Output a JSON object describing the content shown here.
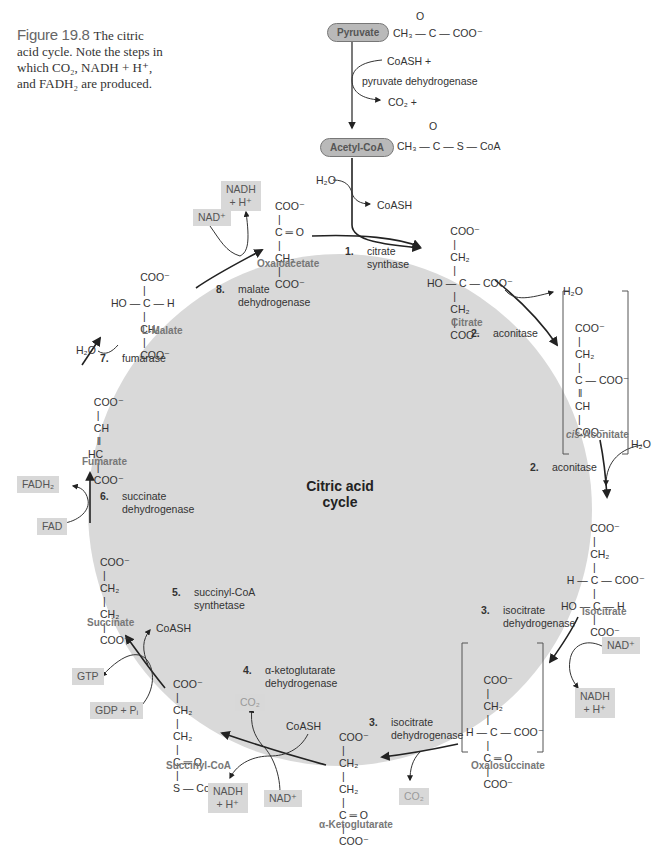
{
  "caption": {
    "figure_label": "Figure 19.8",
    "text": "The citric acid cycle. Note the steps in which CO₂, NADH + H⁺, and FADH₂ are produced."
  },
  "entry": {
    "pyruvate": {
      "label": "Pyruvate",
      "formula": "CH₃ — C — COO⁻",
      "carbonyl": "O"
    },
    "pdh_inputs": "CoASH +",
    "pdh_enzyme": "pyruvate dehydrogenase",
    "pdh_output": "CO₂ +",
    "acetyl_coa": {
      "label": "Acetyl-CoA",
      "formula": "CH₃ — C — S — CoA",
      "carbonyl": "O"
    },
    "water_in": "H₂O",
    "coash_out": "CoASH"
  },
  "center_label": {
    "line1": "Citric acid",
    "line2": "cycle"
  },
  "molecules": {
    "citrate": {
      "name": "Citrate",
      "lines": [
        "        COO⁻",
        "         |",
        "        CH₂",
        "         |",
        "HO — C — COO⁻",
        "         |",
        "        CH₂",
        "         |",
        "        COO⁻"
      ]
    },
    "cis_aconitate": {
      "name_italic": "cis",
      "name": "-Aconitate",
      "lines": [
        "COO⁻",
        " |",
        "CH₂",
        " |",
        "C — COO⁻",
        " ‖",
        "CH",
        " |",
        "COO⁻"
      ]
    },
    "isocitrate": {
      "name": "Isocitrate",
      "lines": [
        "          COO⁻",
        "           |",
        "          CH₂",
        "           |",
        "  H — C — COO⁻",
        "           |",
        "HO — C — H",
        "           |",
        "          COO⁻"
      ]
    },
    "oxalosuccinate": {
      "name": "Oxalosuccinate",
      "lines": [
        "      COO⁻",
        "       |",
        "      CH₂",
        "       |",
        "H — C — COO⁻",
        "       |",
        "      C ═ O",
        "       |",
        "      COO⁻"
      ]
    },
    "alpha_ketoglutarate": {
      "name": "α-Ketoglutarate",
      "lines": [
        "COO⁻",
        " |",
        "CH₂",
        " |",
        "CH₂",
        " |",
        "C ═ O",
        " |",
        "COO⁻"
      ]
    },
    "succinyl_coa": {
      "name": "Succinyl-CoA",
      "lines": [
        "COO⁻",
        " |",
        "CH₂",
        " |",
        "CH₂",
        " |",
        "C ═ O",
        " |",
        "S — CoA"
      ]
    },
    "succinate": {
      "name": "Succinate",
      "lines": [
        "COO⁻",
        " |",
        "CH₂",
        " |",
        "CH₂",
        " |",
        "COO⁻"
      ]
    },
    "fumarate": {
      "name": "Fumarate",
      "lines": [
        "  COO⁻",
        "   |",
        "  CH",
        "   ‖",
        "HC",
        "   |",
        "  COO⁻"
      ]
    },
    "l_malate": {
      "name": "L-Malate",
      "lines": [
        "          COO⁻",
        "           |",
        "HO — C — H",
        "           |",
        "          CH₂",
        "           |",
        "          COO⁻"
      ]
    },
    "oxaloacetate": {
      "name": "Oxaloacetate",
      "lines": [
        "COO⁻",
        " |",
        "C ═ O",
        " |",
        "CH₂",
        " |",
        "COO⁻"
      ]
    }
  },
  "steps": [
    {
      "num": "1.",
      "enzyme": [
        "citrate",
        "synthase"
      ]
    },
    {
      "num": "2.",
      "enzyme": [
        "aconitase"
      ]
    },
    {
      "num": "2.",
      "enzyme": [
        "aconitase"
      ]
    },
    {
      "num": "3.",
      "enzyme": [
        "isocitrate",
        "dehydrogenase"
      ]
    },
    {
      "num": "3.",
      "enzyme": [
        "isocitrate",
        "dehydrogenase"
      ]
    },
    {
      "num": "4.",
      "enzyme": [
        "α-ketoglutarate",
        "dehydrogenase"
      ]
    },
    {
      "num": "5.",
      "enzyme": [
        "succinyl-CoA",
        "synthetase"
      ]
    },
    {
      "num": "6.",
      "enzyme": [
        "succinate",
        "dehydrogenase"
      ]
    },
    {
      "num": "7.",
      "enzyme": [
        "fumarase"
      ]
    },
    {
      "num": "8.",
      "enzyme": [
        "malate",
        "dehydrogenase"
      ]
    }
  ],
  "side_products": {
    "h2o_aconitase_out": "H₂O",
    "h2o_aconitase_in": "H₂O",
    "nad_step3": "NAD⁺",
    "nadh_step3": [
      "NADH",
      "+ H⁺"
    ],
    "co2_step3": "CO₂",
    "co2_step4": "CO₂",
    "coash_step4": "CoASH",
    "nad_step4": "NAD⁺",
    "nadh_step4": [
      "NADH",
      "+ H⁺"
    ],
    "coash_step5": "CoASH",
    "gtp_step5": "GTP",
    "gdp_step5": "GDP + Pᵢ",
    "fadh2_step6": "FADH₂",
    "fad_step6": "FAD",
    "h2o_step7": "H₂O",
    "nad_step8": "NAD⁺",
    "nadh_step8": [
      "NADH",
      "+ H⁺"
    ]
  },
  "colors": {
    "cycle_fill": "#d9d9d9",
    "box_fill": "#d8d8d8",
    "pill_fill": "#b9b9b9",
    "arrow": "#222222"
  }
}
